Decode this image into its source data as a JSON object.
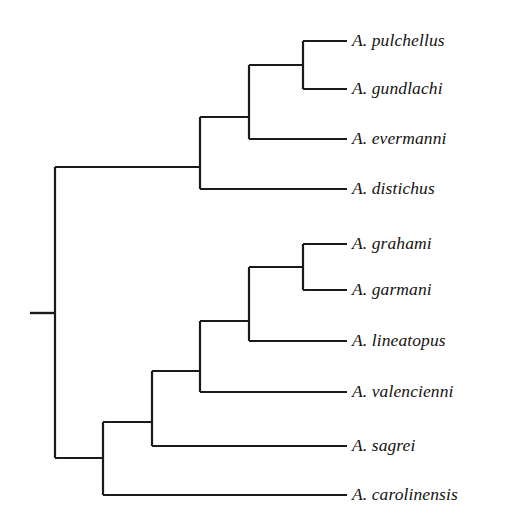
{
  "figure": {
    "type": "cladogram",
    "title": "",
    "background_color": "#ffffff",
    "line_color": "#1a1a1a",
    "text_color": "#15130f",
    "line_width": 2.2,
    "width": 505,
    "height": 532
  },
  "taxa": [
    {
      "label": "A. pulchellus",
      "row": 0,
      "y": 41,
      "tip_x": 347,
      "branch_start_x": 303
    },
    {
      "label": "A. gundlachi",
      "row": 1,
      "y": 89,
      "tip_x": 347,
      "branch_start_x": 303
    },
    {
      "label": "A. evermanni",
      "row": 2,
      "y": 139,
      "tip_x": 347,
      "branch_start_x": 249
    },
    {
      "label": "A. distichus",
      "row": 3,
      "y": 189,
      "tip_x": 347,
      "branch_start_x": 200
    },
    {
      "label": "A. grahami",
      "row": 4,
      "y": 244,
      "tip_x": 347,
      "branch_start_x": 303
    },
    {
      "label": "A. garmani",
      "row": 5,
      "y": 290,
      "tip_x": 347,
      "branch_start_x": 303
    },
    {
      "label": "A. lineatopus",
      "row": 6,
      "y": 341,
      "tip_x": 347,
      "branch_start_x": 249
    },
    {
      "label": "A. valencienni",
      "row": 7,
      "y": 392,
      "tip_x": 347,
      "branch_start_x": 200
    },
    {
      "label": "A. sagrei",
      "row": 8,
      "y": 446,
      "tip_x": 347,
      "branch_start_x": 152
    },
    {
      "label": "A. carolinensis",
      "row": 9,
      "y": 495,
      "tip_x": 347,
      "branch_start_x": 103
    }
  ],
  "label_x": 352,
  "nodes": [
    {
      "name": "node-pulchellus-gundlachi",
      "x": 303,
      "y_top": 41,
      "y_bottom": 89,
      "stem_to_x": 249,
      "stem_y": 65
    },
    {
      "name": "node-puerto-rican-clade",
      "x": 249,
      "y_top": 65,
      "y_bottom": 139,
      "stem_to_x": 200,
      "stem_y": 117
    },
    {
      "name": "node-upper-clade",
      "x": 200,
      "y_top": 117,
      "y_bottom": 189,
      "stem_to_x": 55,
      "stem_y": 167
    },
    {
      "name": "node-grahami-garmani",
      "x": 303,
      "y_top": 244,
      "y_bottom": 290,
      "stem_to_x": 249,
      "stem_y": 267
    },
    {
      "name": "node-jamaican-clade",
      "x": 249,
      "y_top": 267,
      "y_bottom": 341,
      "stem_to_x": 200,
      "stem_y": 321
    },
    {
      "name": "node-jamaican-plus-valencienni",
      "x": 200,
      "y_top": 321,
      "y_bottom": 392,
      "stem_to_x": 152,
      "stem_y": 371
    },
    {
      "name": "node-plus-sagrei",
      "x": 152,
      "y_top": 371,
      "y_bottom": 446,
      "stem_to_x": 103,
      "stem_y": 422
    },
    {
      "name": "node-lower-clade",
      "x": 103,
      "y_top": 422,
      "y_bottom": 495,
      "stem_to_x": 55,
      "stem_y": 458
    },
    {
      "name": "node-root",
      "x": 55,
      "y_top": 167,
      "y_bottom": 458,
      "stem_to_x": 30,
      "stem_y": 313
    }
  ],
  "root": {
    "stem_x_start": 30,
    "stem_x_end": 55,
    "stem_y": 313
  }
}
